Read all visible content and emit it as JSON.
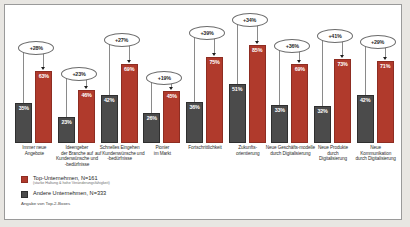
{
  "chart_data": {
    "type": "bar",
    "title": "",
    "xlabel": "",
    "ylabel": "",
    "ylim": [
      0,
      100
    ],
    "grid": false,
    "legend_position": "bottom-left",
    "categories": [
      "Immer neue\nAngebote",
      "Ideengeber\nder Branche auf Kundenwünsche und\n-bedürfnisse",
      "Schnelles Eingehen\nauf Kundenwünsche und\n-bedürfnisse",
      "Pionier\nim Markt",
      "Fortschrittlichkeit",
      "Zukunfts-\norientierung",
      "Neue Geschäfts-modelle\ndurch Digitalisierung",
      "Neue Produkte\ndurch\nDigitalisierung",
      "Neue\nKommunikation\ndurch Digitalisierung"
    ],
    "series": [
      {
        "name": "Andere Unternehmen",
        "color": "#4b4b4b",
        "values": [
          35,
          23,
          42,
          26,
          36,
          51,
          33,
          32,
          42
        ],
        "labels": [
          "35%",
          "23%",
          "42%",
          "26%",
          "36%",
          "51%",
          "33%",
          "32%",
          "42%"
        ]
      },
      {
        "name": "Top-Unternehmen",
        "color": "#b03a2c",
        "values": [
          63,
          46,
          69,
          45,
          75,
          85,
          69,
          73,
          71
        ],
        "labels": [
          "63%",
          "46%",
          "69%",
          "45%",
          "75%",
          "85%",
          "69%",
          "73%",
          "71%"
        ]
      }
    ],
    "annotations": {
      "type": "delta-callout",
      "values": [
        "+28%",
        "+23%",
        "+27%",
        "+19%",
        "+39%",
        "+34%",
        "+36%",
        "+41%",
        "+29%"
      ]
    }
  },
  "legend": {
    "items": [
      {
        "swatch": "top",
        "label": "Top-Unternehmen, N=161",
        "sublabel": "(starke Haltung & hohe Veränderungsfähigkeit)"
      },
      {
        "swatch": "other",
        "label": "Andere Unternehmen, N=333",
        "sublabel": ""
      }
    ]
  },
  "footnote": "Angabe von Top-2-Boxes"
}
